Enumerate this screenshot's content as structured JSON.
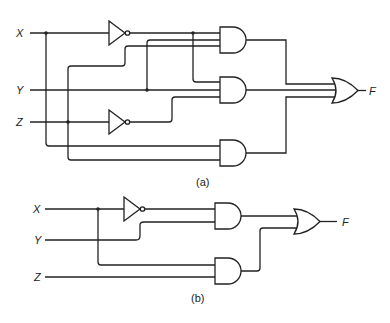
{
  "diagram": {
    "type": "logic-circuit",
    "circuit_a": {
      "caption": "(a)",
      "inputs": [
        "X",
        "Y",
        "Z"
      ],
      "output": "F",
      "gates": [
        {
          "id": "not1",
          "type": "NOT",
          "input": "X"
        },
        {
          "id": "not2",
          "type": "NOT",
          "input": "Z"
        },
        {
          "id": "and1",
          "type": "AND",
          "inputs": [
            "X'",
            "Y",
            "Z"
          ]
        },
        {
          "id": "and2",
          "type": "AND",
          "inputs": [
            "X'",
            "Y",
            "Z'"
          ]
        },
        {
          "id": "and3",
          "type": "AND",
          "inputs": [
            "X",
            "Z"
          ]
        },
        {
          "id": "or1",
          "type": "OR",
          "inputs": [
            "and1",
            "and2",
            "and3"
          ]
        }
      ]
    },
    "circuit_b": {
      "caption": "(b)",
      "inputs": [
        "X",
        "Y",
        "Z"
      ],
      "output": "F",
      "gates": [
        {
          "id": "not1",
          "type": "NOT",
          "input": "X"
        },
        {
          "id": "and1",
          "type": "AND",
          "inputs": [
            "X'",
            "Y"
          ]
        },
        {
          "id": "and2",
          "type": "AND",
          "inputs": [
            "X",
            "Z"
          ]
        },
        {
          "id": "or1",
          "type": "OR",
          "inputs": [
            "and1",
            "and2"
          ]
        }
      ]
    }
  }
}
